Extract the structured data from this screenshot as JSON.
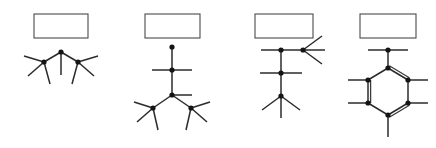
{
  "page": {
    "background_color": "#ffffff",
    "bond_color": "#2b2b2b",
    "atom_color": "#141414",
    "box_border_color": "#4a4a4a",
    "width": 436,
    "height": 148
  },
  "structures": [
    {
      "id": "structure-1",
      "name": "branched-three-carbon-skeleton",
      "answer_box": {
        "label": "",
        "x": 34,
        "y": 14,
        "width": 54,
        "height": 24
      },
      "atoms": [
        {
          "id": "a1",
          "x": 61,
          "y": 52
        },
        {
          "id": "a2",
          "x": 44,
          "y": 62
        },
        {
          "id": "a3",
          "x": 78,
          "y": 62
        }
      ],
      "bonds": [
        {
          "from": [
            61,
            52
          ],
          "to": [
            44,
            62
          ],
          "order": 1
        },
        {
          "from": [
            61,
            52
          ],
          "to": [
            78,
            62
          ],
          "order": 1
        },
        {
          "from": [
            61,
            52
          ],
          "to": [
            61,
            75
          ],
          "order": 1
        },
        {
          "from": [
            44,
            62
          ],
          "to": [
            24,
            56
          ],
          "order": 1
        },
        {
          "from": [
            44,
            62
          ],
          "to": [
            28,
            76
          ],
          "order": 1
        },
        {
          "from": [
            44,
            62
          ],
          "to": [
            50,
            84
          ],
          "order": 1
        },
        {
          "from": [
            78,
            62
          ],
          "to": [
            98,
            56
          ],
          "order": 1
        },
        {
          "from": [
            78,
            62
          ],
          "to": [
            94,
            76
          ],
          "order": 1
        },
        {
          "from": [
            78,
            62
          ],
          "to": [
            72,
            84
          ],
          "order": 1
        }
      ]
    },
    {
      "id": "structure-2",
      "name": "vertical-chain-with-branch",
      "answer_box": {
        "label": "",
        "x": 145,
        "y": 14,
        "width": 55,
        "height": 24
      },
      "atoms": [
        {
          "id": "b1",
          "x": 172,
          "y": 47
        },
        {
          "id": "b2",
          "x": 172,
          "y": 70
        },
        {
          "id": "b3",
          "x": 172,
          "y": 95
        },
        {
          "id": "b4",
          "x": 153,
          "y": 108
        },
        {
          "id": "b5",
          "x": 191,
          "y": 108
        }
      ],
      "bonds": [
        {
          "from": [
            172,
            47
          ],
          "to": [
            172,
            70
          ],
          "order": 1
        },
        {
          "from": [
            172,
            70
          ],
          "to": [
            152,
            70
          ],
          "order": 1
        },
        {
          "from": [
            172,
            70
          ],
          "to": [
            192,
            70
          ],
          "order": 1
        },
        {
          "from": [
            172,
            70
          ],
          "to": [
            172,
            95
          ],
          "order": 1
        },
        {
          "from": [
            172,
            95
          ],
          "to": [
            192,
            95
          ],
          "order": 1
        },
        {
          "from": [
            172,
            95
          ],
          "to": [
            153,
            108
          ],
          "order": 1
        },
        {
          "from": [
            172,
            95
          ],
          "to": [
            191,
            108
          ],
          "order": 1
        },
        {
          "from": [
            153,
            108
          ],
          "to": [
            134,
            102
          ],
          "order": 1
        },
        {
          "from": [
            153,
            108
          ],
          "to": [
            137,
            122
          ],
          "order": 1
        },
        {
          "from": [
            153,
            108
          ],
          "to": [
            158,
            130
          ],
          "order": 1
        },
        {
          "from": [
            191,
            108
          ],
          "to": [
            210,
            102
          ],
          "order": 1
        },
        {
          "from": [
            191,
            108
          ],
          "to": [
            207,
            122
          ],
          "order": 1
        },
        {
          "from": [
            191,
            108
          ],
          "to": [
            186,
            130
          ],
          "order": 1
        }
      ]
    },
    {
      "id": "structure-3",
      "name": "chain-with-top-right-branch",
      "answer_box": {
        "label": "",
        "x": 255,
        "y": 14,
        "width": 58,
        "height": 24
      },
      "atoms": [
        {
          "id": "c1",
          "x": 281,
          "y": 50
        },
        {
          "id": "c2",
          "x": 303,
          "y": 50
        },
        {
          "id": "c3",
          "x": 281,
          "y": 73
        },
        {
          "id": "c4",
          "x": 281,
          "y": 96
        }
      ],
      "bonds": [
        {
          "from": [
            281,
            50
          ],
          "to": [
            261,
            50
          ],
          "order": 1
        },
        {
          "from": [
            281,
            50
          ],
          "to": [
            303,
            50
          ],
          "order": 1
        },
        {
          "from": [
            303,
            50
          ],
          "to": [
            322,
            36
          ],
          "order": 1
        },
        {
          "from": [
            303,
            50
          ],
          "to": [
            325,
            50
          ],
          "order": 1
        },
        {
          "from": [
            303,
            50
          ],
          "to": [
            322,
            64
          ],
          "order": 1
        },
        {
          "from": [
            281,
            50
          ],
          "to": [
            281,
            73
          ],
          "order": 1
        },
        {
          "from": [
            281,
            73
          ],
          "to": [
            260,
            73
          ],
          "order": 1
        },
        {
          "from": [
            281,
            73
          ],
          "to": [
            302,
            73
          ],
          "order": 1
        },
        {
          "from": [
            281,
            73
          ],
          "to": [
            281,
            96
          ],
          "order": 1
        },
        {
          "from": [
            281,
            96
          ],
          "to": [
            262,
            110
          ],
          "order": 1
        },
        {
          "from": [
            281,
            96
          ],
          "to": [
            300,
            110
          ],
          "order": 1
        },
        {
          "from": [
            281,
            96
          ],
          "to": [
            281,
            118
          ],
          "order": 1
        }
      ]
    },
    {
      "id": "structure-4",
      "name": "benzene-ring-with-methylene",
      "answer_box": {
        "label": "",
        "x": 360,
        "y": 14,
        "width": 56,
        "height": 24
      },
      "atoms": [
        {
          "id": "d0",
          "x": 388,
          "y": 50
        },
        {
          "id": "d1",
          "x": 388,
          "y": 68
        },
        {
          "id": "d2",
          "x": 408,
          "y": 80
        },
        {
          "id": "d3",
          "x": 408,
          "y": 103
        },
        {
          "id": "d4",
          "x": 388,
          "y": 115
        },
        {
          "id": "d5",
          "x": 368,
          "y": 103
        },
        {
          "id": "d6",
          "x": 368,
          "y": 80
        }
      ],
      "bonds": [
        {
          "from": [
            388,
            50
          ],
          "to": [
            368,
            50
          ],
          "order": 1
        },
        {
          "from": [
            388,
            50
          ],
          "to": [
            408,
            50
          ],
          "order": 1
        },
        {
          "from": [
            388,
            50
          ],
          "to": [
            388,
            68
          ],
          "order": 1
        },
        {
          "from": [
            388,
            68
          ],
          "to": [
            408,
            80
          ],
          "order": 2
        },
        {
          "from": [
            408,
            80
          ],
          "to": [
            408,
            103
          ],
          "order": 1
        },
        {
          "from": [
            408,
            103
          ],
          "to": [
            388,
            115
          ],
          "order": 2
        },
        {
          "from": [
            388,
            115
          ],
          "to": [
            368,
            103
          ],
          "order": 1
        },
        {
          "from": [
            368,
            103
          ],
          "to": [
            368,
            80
          ],
          "order": 2
        },
        {
          "from": [
            368,
            80
          ],
          "to": [
            388,
            68
          ],
          "order": 1
        },
        {
          "from": [
            408,
            80
          ],
          "to": [
            428,
            80
          ],
          "order": 1
        },
        {
          "from": [
            408,
            103
          ],
          "to": [
            428,
            103
          ],
          "order": 1
        },
        {
          "from": [
            388,
            115
          ],
          "to": [
            388,
            137
          ],
          "order": 1
        },
        {
          "from": [
            368,
            103
          ],
          "to": [
            348,
            103
          ],
          "order": 1
        },
        {
          "from": [
            368,
            80
          ],
          "to": [
            348,
            80
          ],
          "order": 1
        }
      ]
    }
  ]
}
